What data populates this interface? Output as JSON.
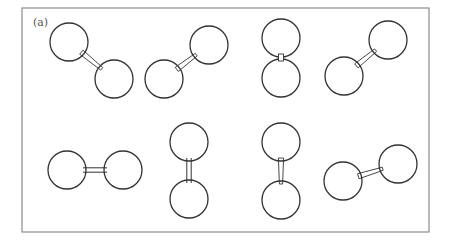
{
  "figure": {
    "panel_label": "(a)",
    "frame": {
      "x": 22,
      "y": 8,
      "width": 407,
      "height": 224,
      "stroke": "#8a8a8a"
    },
    "atom_radius": 19,
    "stroke_color": "#333333",
    "molecules": [
      {
        "id": 1,
        "row": "top",
        "bond": "single-wedge",
        "atoms": [
          [
            69,
            42
          ],
          [
            114,
            79
          ]
        ]
      },
      {
        "id": 2,
        "row": "top",
        "bond": "single-wedge",
        "atoms": [
          [
            164,
            79
          ],
          [
            209,
            45
          ]
        ]
      },
      {
        "id": 3,
        "row": "top",
        "bond": "short-contact",
        "atoms": [
          [
            281,
            38
          ],
          [
            281,
            78
          ]
        ]
      },
      {
        "id": 4,
        "row": "top",
        "bond": "single-wedge",
        "atoms": [
          [
            344,
            76
          ],
          [
            388,
            40
          ]
        ]
      },
      {
        "id": 5,
        "row": "bottom",
        "bond": "double-line",
        "atoms": [
          [
            67,
            170
          ],
          [
            123,
            170
          ]
        ]
      },
      {
        "id": 6,
        "row": "bottom",
        "bond": "double-line",
        "atoms": [
          [
            189,
            142
          ],
          [
            189,
            199
          ]
        ]
      },
      {
        "id": 7,
        "row": "bottom",
        "bond": "single-wedge",
        "atoms": [
          [
            281,
            142
          ],
          [
            281,
            200
          ]
        ]
      },
      {
        "id": 8,
        "row": "bottom",
        "bond": "single-wedge",
        "atoms": [
          [
            343,
            181
          ],
          [
            398,
            164
          ]
        ]
      }
    ]
  }
}
